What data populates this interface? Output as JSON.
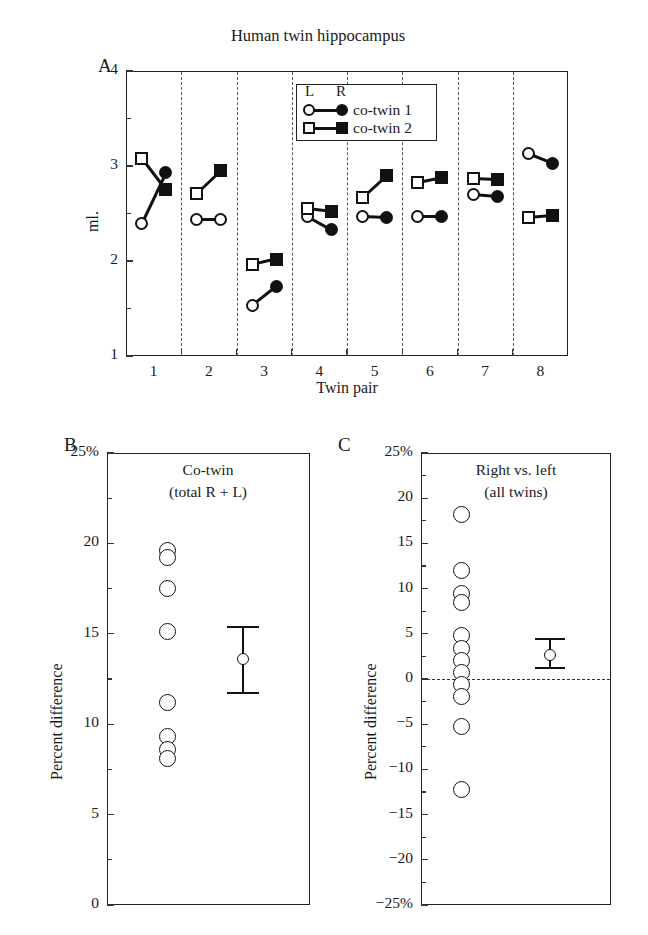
{
  "figure": {
    "title": "Human twin hippocampus",
    "panels": [
      {
        "letter": "A"
      },
      {
        "letter": "B"
      },
      {
        "letter": "C"
      }
    ]
  },
  "panelA": {
    "letter": "A",
    "title": "Human twin hippocampus",
    "ylabel": "ml.",
    "xlabel": "Twin pair",
    "ylim": [
      1,
      4
    ],
    "y_major_ticks": [
      "4",
      "3",
      "2",
      "1"
    ],
    "y_major_values": [
      4,
      3,
      2,
      1
    ],
    "y_minor_values": [
      3.5,
      2.5,
      1.5
    ],
    "x_tick_labels": [
      "1",
      "2",
      "3",
      "4",
      "5",
      "6",
      "7",
      "8"
    ],
    "legend": {
      "header_left": "L",
      "header_right": "R",
      "entries": [
        {
          "label": "co-twin 1",
          "left_marker": "circle-open",
          "right_marker": "circle-filled"
        },
        {
          "label": "co-twin 2",
          "left_marker": "square-open",
          "right_marker": "square-filled"
        }
      ]
    },
    "series": [
      {
        "name": "co-twin 1",
        "left_marker": "circle-open",
        "right_marker": "circle-filled",
        "pairs": [
          {
            "twin_pair": 1,
            "left": 2.4,
            "right": 2.93
          },
          {
            "twin_pair": 2,
            "left": 2.44,
            "right": 2.44,
            "right_marker_override": "circle-open"
          },
          {
            "twin_pair": 3,
            "left": 1.53,
            "right": 1.73
          },
          {
            "twin_pair": 4,
            "left": 2.47,
            "right": 2.33
          },
          {
            "twin_pair": 5,
            "left": 2.47,
            "right": 2.46
          },
          {
            "twin_pair": 6,
            "left": 2.47,
            "right": 2.47
          },
          {
            "twin_pair": 7,
            "left": 2.7,
            "right": 2.68
          },
          {
            "twin_pair": 8,
            "left": 3.13,
            "right": 3.03
          }
        ]
      },
      {
        "name": "co-twin 2",
        "left_marker": "square-open",
        "right_marker": "square-filled",
        "pairs": [
          {
            "twin_pair": 1,
            "left": 3.08,
            "right": 2.75
          },
          {
            "twin_pair": 2,
            "left": 2.71,
            "right": 2.95
          },
          {
            "twin_pair": 3,
            "left": 1.96,
            "right": 2.02
          },
          {
            "twin_pair": 4,
            "left": 2.55,
            "right": 2.52
          },
          {
            "twin_pair": 5,
            "left": 2.67,
            "right": 2.9
          },
          {
            "twin_pair": 6,
            "left": 2.83,
            "right": 2.88
          },
          {
            "twin_pair": 7,
            "left": 2.87,
            "right": 2.86
          },
          {
            "twin_pair": 8,
            "left": 2.46,
            "right": 2.48
          }
        ]
      }
    ]
  },
  "panelB": {
    "letter": "B",
    "title_line1": "Co-twin",
    "title_line2": "(total R + L)",
    "ylabel": "Percent difference",
    "ylim": [
      0,
      25
    ],
    "y_major_ticks": [
      "25%",
      "20",
      "15",
      "10",
      "5",
      "0"
    ],
    "y_major_values": [
      25,
      20,
      15,
      10,
      5,
      0
    ],
    "y_minor_values": [
      22.5,
      17.5,
      12.5,
      7.5,
      2.5
    ],
    "dot_values": [
      19.6,
      19.2,
      17.5,
      15.1,
      11.2,
      9.3,
      8.6,
      8.1
    ],
    "summary": {
      "mean": 13.6,
      "upper": 15.4,
      "lower": 11.7
    }
  },
  "panelC": {
    "letter": "C",
    "title_line1": "Right vs. left",
    "title_line2": "(all twins)",
    "ylabel": "Percent difference",
    "ylim": [
      -25,
      25
    ],
    "y_major_ticks": [
      "25%",
      "20",
      "15",
      "10",
      "5",
      "0",
      "−5",
      "−10",
      "−15",
      "−20",
      "−25%"
    ],
    "y_major_values": [
      25,
      20,
      15,
      10,
      5,
      0,
      -5,
      -10,
      -15,
      -20,
      -25
    ],
    "y_minor_values": [
      22.5,
      17.5,
      12.5,
      7.5,
      2.5,
      -2.5,
      -7.5,
      -12.5,
      -17.5,
      -22.5
    ],
    "zero_line": 0,
    "dot_values": [
      18.2,
      12.0,
      9.5,
      8.5,
      4.8,
      3.4,
      2.0,
      0.7,
      -0.6,
      -1.9,
      -5.2,
      -12.2
    ],
    "summary": {
      "mean": 2.7,
      "upper": 4.4,
      "lower": 1.2
    }
  }
}
